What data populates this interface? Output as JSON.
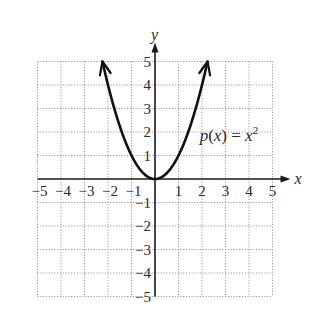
{
  "chart_data": {
    "type": "line",
    "title": "",
    "xlabel": "x",
    "ylabel": "y",
    "xlim": [
      -5,
      5
    ],
    "ylim": [
      -5,
      5
    ],
    "grid": true,
    "x_ticks": [
      -5,
      -4,
      -3,
      -2,
      -1,
      1,
      2,
      3,
      4,
      5
    ],
    "y_ticks": [
      5,
      4,
      3,
      2,
      1,
      -1,
      -2,
      -3,
      -4,
      -5
    ],
    "x_tick_labels": [
      "−5",
      "−4",
      "−3",
      "−2",
      "−1",
      "1",
      "2",
      "3",
      "4",
      "5"
    ],
    "y_tick_labels": [
      "5",
      "4",
      "3",
      "2",
      "1",
      "−1",
      "−2",
      "−3",
      "−4",
      "−5"
    ],
    "series": [
      {
        "name": "p(x) = x^2",
        "function": "x^2",
        "x_range": [
          -2.236,
          2.236
        ],
        "arrows_at_ends": true,
        "sample_points": [
          {
            "x": -2.236,
            "y": 5
          },
          {
            "x": -2,
            "y": 4
          },
          {
            "x": -1,
            "y": 1
          },
          {
            "x": 0,
            "y": 0
          },
          {
            "x": 1,
            "y": 1
          },
          {
            "x": 2,
            "y": 4
          },
          {
            "x": 2.236,
            "y": 5
          }
        ]
      }
    ],
    "annotations": [
      {
        "text_parts": [
          "p",
          "(",
          "x",
          ") = ",
          "x",
          "2"
        ],
        "label": "p(x) = x²",
        "anchor_data": {
          "x": 1.9,
          "y": 1.6
        }
      }
    ]
  }
}
